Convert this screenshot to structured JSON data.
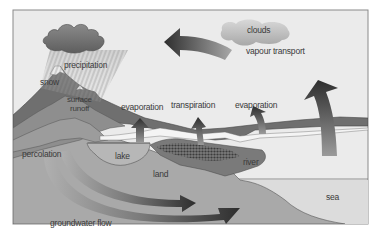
{
  "diagram": {
    "labels": {
      "clouds": "clouds",
      "vapour_transport": "vapour transport",
      "precipitation": "precipitation",
      "snow": "snow",
      "surface_runoff_line1": "surface",
      "surface_runoff_line2": "runoff",
      "evaporation_lake": "evaporation",
      "transpiration": "transpiration",
      "evaporation_river": "evaporation",
      "percolation": "percolation",
      "lake": "lake",
      "land": "land",
      "river": "river",
      "sea": "sea",
      "groundwater_flow": "groundwater flow"
    },
    "colors": {
      "sky": "#ebebeb",
      "frame": "#8a8a8a",
      "mountain_dark": "#6e6e6e",
      "mountain_mid": "#8c8c8c",
      "land": "#a6a6a6",
      "water": "#e6e6e6",
      "sea": "#dcdcdc",
      "arrow_dark": "#3a3a3a",
      "cloud_dark": "#7a7a7a",
      "cloud_light": "#c8c8c8"
    }
  }
}
